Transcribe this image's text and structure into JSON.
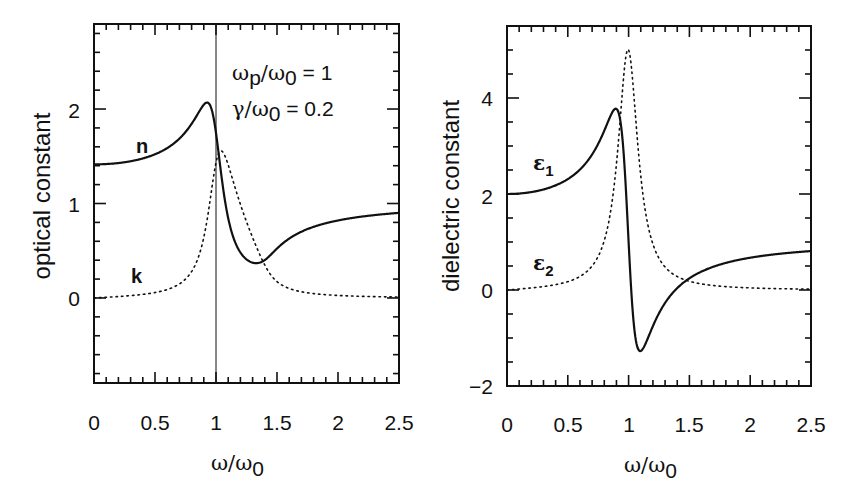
{
  "figure": {
    "model": {
      "type": "lorentz-oscillator",
      "wp_over_w0": 1,
      "gamma_over_w0": 0.2
    },
    "annotation": {
      "line1": "ω_p/ω_0 = 1",
      "line2": "γ/ω_0 = 0.2"
    }
  },
  "chart_data": [
    {
      "type": "line",
      "title": "",
      "xlabel": "ω/ω0",
      "ylabel": "optical constant",
      "xlim": [
        0,
        2.5
      ],
      "ylim": [
        -0.9,
        2.9
      ],
      "x_ticks": [
        "0",
        "0.5",
        "1",
        "1.5",
        "2",
        "2.5"
      ],
      "y_ticks": [
        "0",
        "1",
        "2"
      ],
      "grid": false,
      "vertical_reference_line": 1,
      "series": [
        {
          "name": "n",
          "style": "solid",
          "x": [
            0,
            0.25,
            0.5,
            0.75,
            0.9,
            0.95,
            1.0,
            1.05,
            1.1,
            1.2,
            1.3,
            1.36,
            1.5,
            1.75,
            2.0,
            2.25,
            2.5
          ],
          "values": [
            1.41,
            1.43,
            1.52,
            1.74,
            2.0,
            2.06,
            1.73,
            1.31,
            0.95,
            0.56,
            0.39,
            0.37,
            0.48,
            0.68,
            0.78,
            0.84,
            0.88
          ]
        },
        {
          "name": "k",
          "style": "dotted",
          "x": [
            0,
            0.25,
            0.5,
            0.75,
            0.9,
            1.0,
            1.05,
            1.1,
            1.2,
            1.3,
            1.5,
            1.75,
            2.0,
            2.25,
            2.5
          ],
          "values": [
            0,
            0.02,
            0.06,
            0.21,
            0.62,
            1.45,
            1.55,
            1.48,
            1.07,
            0.72,
            0.33,
            0.16,
            0.09,
            0.06,
            0.04
          ]
        }
      ],
      "annotations": [
        "ω_p/ω_0 = 1",
        "γ/ω_0 = 0.2"
      ],
      "curve_labels": [
        "n",
        "k"
      ]
    },
    {
      "type": "line",
      "title": "",
      "xlabel": "ω/ω0",
      "ylabel": "dielectric constant",
      "xlim": [
        0,
        2.5
      ],
      "ylim": [
        -2,
        5.5
      ],
      "x_ticks": [
        "0",
        "0.5",
        "1",
        "1.5",
        "2",
        "2.5"
      ],
      "y_ticks": [
        "-2",
        "0",
        "2",
        "4"
      ],
      "grid": false,
      "series": [
        {
          "name": "ε1",
          "style": "solid",
          "x": [
            0,
            0.25,
            0.5,
            0.75,
            0.85,
            0.9,
            0.95,
            1.0,
            1.05,
            1.1,
            1.2,
            1.3,
            1.5,
            1.75,
            2.0,
            2.25,
            2.5
          ],
          "values": [
            2.0,
            2.07,
            2.33,
            3.2,
            3.66,
            3.75,
            3.09,
            1.0,
            -1.1,
            -1.28,
            -0.86,
            -0.39,
            0.16,
            0.46,
            0.63,
            0.72,
            0.78
          ]
        },
        {
          "name": "ε2",
          "style": "dotted",
          "x": [
            0,
            0.25,
            0.5,
            0.75,
            0.9,
            0.95,
            1.0,
            1.05,
            1.1,
            1.2,
            1.3,
            1.5,
            1.75,
            2.0,
            2.5
          ],
          "values": [
            0,
            0.05,
            0.17,
            0.75,
            2.48,
            4.05,
            5.0,
            4.04,
            2.68,
            1.07,
            0.5,
            0.19,
            0.08,
            0.04,
            0.02
          ]
        }
      ],
      "curve_labels": [
        "ε1",
        "ε2"
      ]
    }
  ],
  "panels": {
    "left": {
      "ylabel": "optical constant",
      "xlabel_main": "ω/ω",
      "xlabel_sub": "0",
      "x_tick_labels": [
        "0",
        "0.5",
        "1",
        "1.5",
        "2",
        "2.5"
      ],
      "y_tick_labels": [
        "0",
        "1",
        "2"
      ],
      "label_n": "n",
      "label_k": "k",
      "annot1_main": "ω",
      "annot1_sub1": "p",
      "annot1_mid": "/ω",
      "annot1_sub2": "0",
      "annot1_rest": " =  1",
      "annot2_main": "γ/ω",
      "annot2_sub": "0",
      "annot2_rest": " =  0.2"
    },
    "right": {
      "ylabel": "dielectric constant",
      "xlabel_main": "ω/ω",
      "xlabel_sub": "0",
      "x_tick_labels": [
        "0",
        "0.5",
        "1",
        "1.5",
        "2",
        "2.5"
      ],
      "y_tick_labels": [
        "−2",
        "0",
        "2",
        "4"
      ],
      "label_e1_main": "ε",
      "label_e1_sub": "1",
      "label_e2_main": "ε",
      "label_e2_sub": "2"
    }
  },
  "colors": {
    "ink": "#111111",
    "background": "#ffffff"
  }
}
